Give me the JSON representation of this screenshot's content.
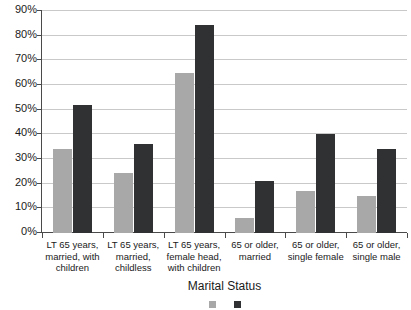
{
  "chart_data": {
    "type": "bar",
    "title": "",
    "xlabel": "Marital Status",
    "ylabel": "",
    "ylim": [
      0,
      90
    ],
    "ytick_step": 10,
    "grid": true,
    "legend_position": "bottom",
    "categories": [
      "LT 65 years, married, with children",
      "LT 65 years, married, childless",
      "LT 65 years, female head, with children",
      "65 or older, married",
      "65 or older, single female",
      "65 or older, single male"
    ],
    "category_lines": [
      [
        "LT 65 years,",
        "married, with",
        "children"
      ],
      [
        "LT 65 years,",
        "married,",
        "childless"
      ],
      [
        "LT 65 years,",
        "female head,",
        "with children"
      ],
      [
        "65 or older,",
        "married"
      ],
      [
        "65 or older,",
        "single female"
      ],
      [
        "65 or older,",
        "single male"
      ]
    ],
    "ytick_labels": [
      "90%",
      "80%",
      "70%",
      "60%",
      "50%",
      "40%",
      "30%",
      "20%",
      "10%",
      "0%"
    ],
    "ytick_values": [
      90,
      80,
      70,
      60,
      50,
      40,
      30,
      20,
      10,
      0
    ],
    "series": [
      {
        "name": "series-a",
        "color": "#a8a8a8",
        "values": [
          34,
          24.5,
          65,
          6,
          17,
          15
        ]
      },
      {
        "name": "series-b",
        "color": "#2f3132",
        "values": [
          52,
          36,
          84.5,
          21,
          40,
          34
        ]
      }
    ]
  },
  "axis": {
    "x_title": "Marital Status"
  },
  "colors": {
    "series_a": "#a8a8a8",
    "series_b": "#2f3132",
    "gridline": "#c9c9c9",
    "axis": "#4a4a4a",
    "background": "#ffffff"
  }
}
